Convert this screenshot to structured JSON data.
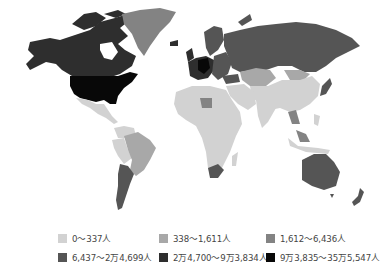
{
  "map": {
    "type": "choropleth-world",
    "classes": [
      {
        "id": "c1",
        "label": "0〜337人",
        "color": "#d2d2d2"
      },
      {
        "id": "c2",
        "label": "338〜1,611人",
        "color": "#a8a8a8"
      },
      {
        "id": "c3",
        "label": "1,612〜6,436人",
        "color": "#838383"
      },
      {
        "id": "c4",
        "label": "6,437〜2万4,699人",
        "color": "#555555"
      },
      {
        "id": "c5",
        "label": "2万4,700〜9万3,834人",
        "color": "#2e2e2e"
      },
      {
        "id": "c6",
        "label": "9万3,835〜35万5,547人",
        "color": "#080808"
      }
    ]
  },
  "legend": {
    "items": [
      {
        "label": "0〜337人",
        "color": "#d2d2d2"
      },
      {
        "label": "338〜1,611人",
        "color": "#a8a8a8"
      },
      {
        "label": "1,612〜6,436人",
        "color": "#838383"
      },
      {
        "label": "6,437〜2万4,699人",
        "color": "#555555"
      },
      {
        "label": "2万4,700〜9万3,834人",
        "color": "#2e2e2e"
      },
      {
        "label": "9万3,835〜35万5,547人",
        "color": "#080808"
      }
    ]
  }
}
